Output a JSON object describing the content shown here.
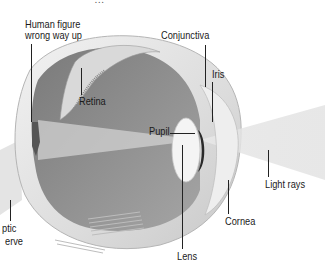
{
  "figure": {
    "caption_fragment": "...the eye ... g ... y ...",
    "labels": {
      "human_figure_line1": "Human figure",
      "human_figure_line2": "wrong way up",
      "retina": "Retina",
      "conjunctiva": "Conjunctiva",
      "iris": "Iris",
      "pupil": "Pupil",
      "light_rays": "Light rays",
      "cornea": "Cornea",
      "lens": "Lens",
      "optic_nerve_line1": "ptic",
      "optic_nerve_line2": "erve"
    }
  }
}
